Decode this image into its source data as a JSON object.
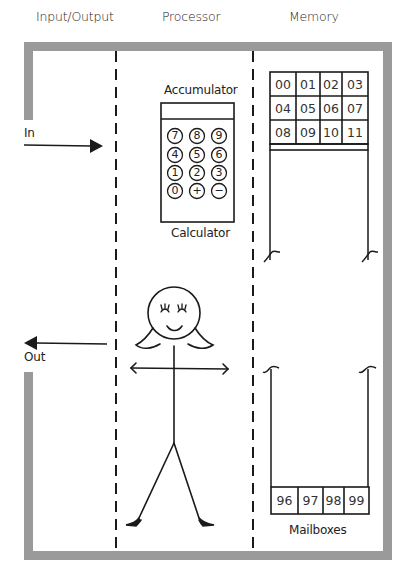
{
  "headers": {
    "io": "Input/Output",
    "processor": "Processor",
    "memory": "Memory"
  },
  "io": {
    "in_label": "In",
    "out_label": "Out"
  },
  "processor": {
    "accumulator_label": "Accumulator",
    "calculator_label": "Calculator",
    "keys": [
      "7",
      "8",
      "9",
      "4",
      "5",
      "6",
      "1",
      "2",
      "3",
      "0",
      "+",
      "−"
    ]
  },
  "memory": {
    "top_cells": [
      "00",
      "01",
      "02",
      "03",
      "04",
      "05",
      "06",
      "07",
      "08",
      "09",
      "10",
      "11"
    ],
    "bottom_cells": [
      "96",
      "97",
      "98",
      "99"
    ],
    "mailboxes_label": "Mailboxes"
  },
  "colors": {
    "frame": "#9a9a9a",
    "ink": "#1a1a1a"
  }
}
